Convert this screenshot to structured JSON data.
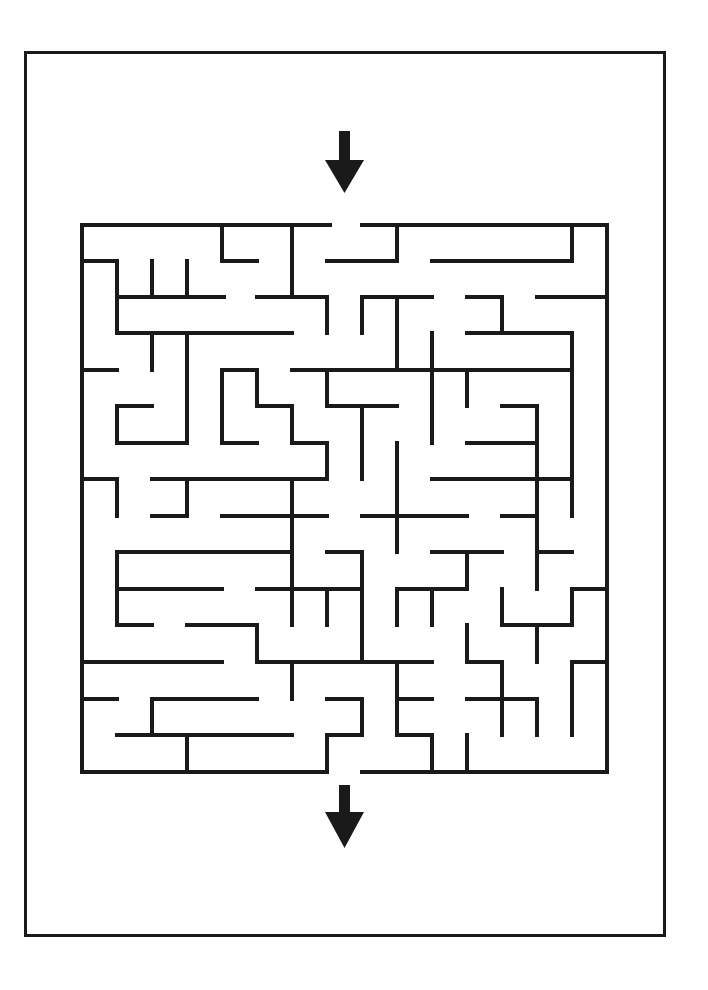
{
  "puzzle": {
    "type": "maze",
    "grid": {
      "cols": 15,
      "rows": 15
    },
    "wall_color": "#1a1a1a",
    "background": "#ffffff",
    "entrance_arrow": {
      "direction": "down",
      "position": "top"
    },
    "exit_arrow": {
      "direction": "down",
      "position": "bottom"
    }
  },
  "walls": {
    "h": [
      [
        225,
        82,
        330
      ],
      [
        225,
        362,
        607
      ],
      [
        261,
        82,
        117
      ],
      [
        261,
        222,
        257
      ],
      [
        261,
        327,
        397
      ],
      [
        261,
        432,
        572
      ],
      [
        297,
        117,
        224
      ],
      [
        297,
        257,
        327
      ],
      [
        297,
        362,
        432
      ],
      [
        297,
        467,
        502
      ],
      [
        297,
        537,
        607
      ],
      [
        333,
        117,
        292
      ],
      [
        333,
        467,
        572
      ],
      [
        370,
        82,
        117
      ],
      [
        370,
        222,
        257
      ],
      [
        370,
        292,
        572
      ],
      [
        406,
        117,
        152
      ],
      [
        406,
        257,
        292
      ],
      [
        406,
        327,
        397
      ],
      [
        406,
        502,
        537
      ],
      [
        443,
        117,
        187
      ],
      [
        443,
        222,
        257
      ],
      [
        443,
        292,
        327
      ],
      [
        443,
        467,
        537
      ],
      [
        479,
        82,
        117
      ],
      [
        479,
        152,
        327
      ],
      [
        479,
        432,
        572
      ],
      [
        516,
        152,
        187
      ],
      [
        516,
        222,
        327
      ],
      [
        516,
        362,
        467
      ],
      [
        516,
        502,
        537
      ],
      [
        552,
        117,
        292
      ],
      [
        552,
        327,
        362
      ],
      [
        552,
        432,
        502
      ],
      [
        552,
        537,
        572
      ],
      [
        589,
        117,
        222
      ],
      [
        589,
        257,
        362
      ],
      [
        589,
        397,
        467
      ],
      [
        589,
        572,
        607
      ],
      [
        625,
        117,
        152
      ],
      [
        625,
        187,
        257
      ],
      [
        625,
        502,
        572
      ],
      [
        662,
        82,
        222
      ],
      [
        662,
        257,
        432
      ],
      [
        662,
        467,
        502
      ],
      [
        662,
        572,
        607
      ],
      [
        699,
        82,
        117
      ],
      [
        699,
        152,
        257
      ],
      [
        699,
        327,
        362
      ],
      [
        699,
        397,
        432
      ],
      [
        699,
        467,
        537
      ],
      [
        735,
        117,
        292
      ],
      [
        735,
        327,
        362
      ],
      [
        735,
        397,
        432
      ],
      [
        772,
        82,
        327
      ],
      [
        772,
        362,
        607
      ]
    ],
    "v": [
      [
        82,
        225,
        772
      ],
      [
        607,
        225,
        772
      ],
      [
        117,
        261,
        333
      ],
      [
        117,
        406,
        443
      ],
      [
        117,
        479,
        516
      ],
      [
        117,
        552,
        625
      ],
      [
        152,
        261,
        297
      ],
      [
        152,
        333,
        370
      ],
      [
        152,
        699,
        735
      ],
      [
        187,
        261,
        297
      ],
      [
        187,
        333,
        443
      ],
      [
        187,
        479,
        516
      ],
      [
        187,
        735,
        772
      ],
      [
        222,
        225,
        261
      ],
      [
        222,
        370,
        443
      ],
      [
        257,
        370,
        406
      ],
      [
        257,
        625,
        662
      ],
      [
        292,
        225,
        297
      ],
      [
        292,
        406,
        443
      ],
      [
        292,
        479,
        625
      ],
      [
        292,
        662,
        699
      ],
      [
        327,
        297,
        333
      ],
      [
        327,
        370,
        406
      ],
      [
        327,
        443,
        479
      ],
      [
        327,
        589,
        625
      ],
      [
        327,
        735,
        772
      ],
      [
        362,
        297,
        333
      ],
      [
        362,
        406,
        479
      ],
      [
        362,
        552,
        662
      ],
      [
        362,
        699,
        735
      ],
      [
        397,
        225,
        261
      ],
      [
        397,
        297,
        370
      ],
      [
        397,
        443,
        552
      ],
      [
        397,
        589,
        625
      ],
      [
        397,
        662,
        735
      ],
      [
        432,
        333,
        443
      ],
      [
        432,
        589,
        625
      ],
      [
        432,
        735,
        772
      ],
      [
        467,
        370,
        406
      ],
      [
        467,
        552,
        589
      ],
      [
        467,
        625,
        662
      ],
      [
        467,
        735,
        772
      ],
      [
        502,
        297,
        333
      ],
      [
        502,
        589,
        625
      ],
      [
        502,
        662,
        735
      ],
      [
        537,
        406,
        589
      ],
      [
        537,
        625,
        662
      ],
      [
        537,
        699,
        735
      ],
      [
        572,
        225,
        261
      ],
      [
        572,
        333,
        516
      ],
      [
        572,
        589,
        625
      ],
      [
        572,
        662,
        735
      ]
    ]
  }
}
